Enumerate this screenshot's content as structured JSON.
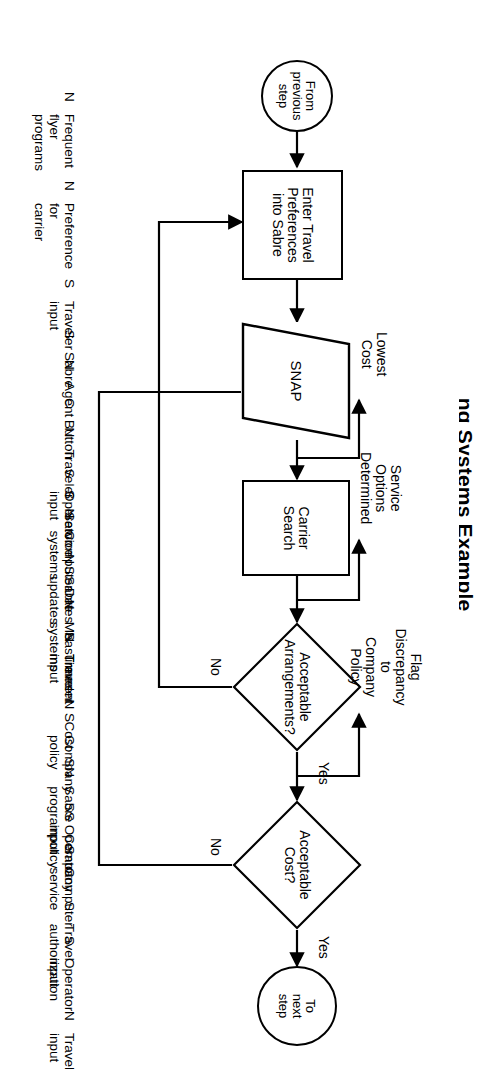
{
  "page": {
    "title_partial": "ng Systems Example"
  },
  "nodes": {
    "start": {
      "name": "start-terminator",
      "label": "From\nprevious\nstep"
    },
    "enter_prefs": {
      "name": "enter-travel-preferences-process",
      "label": "Enter Travel\nPreferences\ninto Sabre"
    },
    "snap": {
      "name": "snap-parallelogram",
      "label": "SNAP"
    },
    "carrier_search": {
      "name": "carrier-search-process",
      "label": "Carrier\nSearch"
    },
    "acceptable_arrangements": {
      "name": "acceptable-arrangements-decision",
      "label": "Acceptable\nArrangements?"
    },
    "acceptable_cost": {
      "name": "acceptable-cost-decision",
      "label": "Acceptable\nCost?"
    },
    "end": {
      "name": "end-terminator",
      "label": "To\nnext\nstep"
    }
  },
  "edge_labels": {
    "lowest_cost": "Lowest\nCost",
    "service_options": "Service\nOptions\nDetermined",
    "arrangements_yes": "Yes",
    "arrangements_no": "No",
    "cost_yes": "Yes",
    "cost_no": "No",
    "flag_discrepancy": "Flag\nDiscrepancy\nto\nCompany\nPolicy"
  },
  "annotations": {
    "enter_prefs": [
      {
        "code": "N",
        "text": "Frequent\nflyer\nprograms"
      },
      {
        "code": "N",
        "text": "Preference\nfor\ncarrier"
      },
      {
        "code": "S",
        "text": "Traveler\ninput"
      },
      {
        "code": "N",
        "text": "Agent"
      },
      {
        "code": "N",
        "text": "Traveler"
      },
      {
        "code": "N",
        "text": "Computer systems"
      },
      {
        "code": "N",
        "text": "Measurement systems"
      }
    ],
    "snap": [
      {
        "code": "S",
        "text": "Sabre"
      },
      {
        "code": "C",
        "text": "Button"
      },
      {
        "code": "S",
        "text": "Operator\ninput"
      },
      {
        "code": "N",
        "text": "Sabre\nupdates"
      }
    ],
    "carrier_search": [
      {
        "code": "S",
        "text": "Service"
      },
      {
        "code": "S",
        "text": "Dates"
      },
      {
        "code": "N",
        "text": "Times"
      },
      {
        "code": "N",
        "text": "Cost"
      },
      {
        "code": "SN",
        "text": "Sabre\nprogram"
      },
      {
        "code": "S",
        "text": "Computer\nservice"
      },
      {
        "code": "S",
        "text": "Operator\ninput"
      }
    ],
    "acceptable_arrangements": [
      {
        "code": "S",
        "text": "Traveler input"
      },
      {
        "code": "S",
        "text": "Company policy"
      },
      {
        "code": "S",
        "text": "Operator input"
      }
    ],
    "acceptable_cost": [
      {
        "code": "S",
        "text": "Company\npolicy"
      },
      {
        "code": "S",
        "text": "Travel\nauthorization"
      },
      {
        "code": "N",
        "text": "Travel\ninput"
      }
    ]
  },
  "colors": {
    "stroke": "#000000",
    "background": "#ffffff"
  }
}
